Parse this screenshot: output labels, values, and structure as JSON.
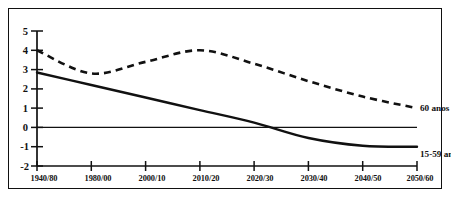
{
  "chart_data": {
    "type": "line",
    "title": "",
    "subtitle": "",
    "xlabel": "",
    "ylabel": "",
    "grid": false,
    "legend_position": "right-inline",
    "categories": [
      "1940/80",
      "1980/00",
      "2000/10",
      "2010/20",
      "2020/30",
      "2030/40",
      "2040/50",
      "2050/60"
    ],
    "xlim": [
      0,
      7
    ],
    "ylim": [
      -2,
      5
    ],
    "yticks": [
      5,
      4,
      3,
      2,
      1,
      0,
      -1,
      -2
    ],
    "ytick_labels": [
      "5",
      "4",
      "3",
      "2",
      "1",
      "0",
      "-1",
      "-2"
    ],
    "zero_line": 0,
    "series": [
      {
        "name": "60 anos +",
        "style": "dashed",
        "color": "#111111",
        "values": [
          4.0,
          2.8,
          3.4,
          4.0,
          3.3,
          2.4,
          1.6,
          1.0
        ]
      },
      {
        "name": "15-59 anos",
        "style": "solid",
        "color": "#111111",
        "values": [
          2.85,
          2.2,
          1.55,
          0.9,
          0.25,
          -0.55,
          -0.95,
          -1.0
        ]
      }
    ],
    "annotations": [
      {
        "text": "60 anos +",
        "series": "60 anos +",
        "x": 7,
        "y": 1.0
      },
      {
        "text": "15-59 anos",
        "series": "15-59 anos",
        "x": 7,
        "y": -1.0
      }
    ]
  },
  "legend": {
    "older": "60 anos +",
    "working_age": "15-59 anos"
  },
  "axes": {
    "y_tick_0": "5",
    "y_tick_1": "4",
    "y_tick_2": "3",
    "y_tick_3": "2",
    "y_tick_4": "1",
    "y_tick_5": "0",
    "y_tick_6": "-1",
    "y_tick_7": "-2"
  }
}
